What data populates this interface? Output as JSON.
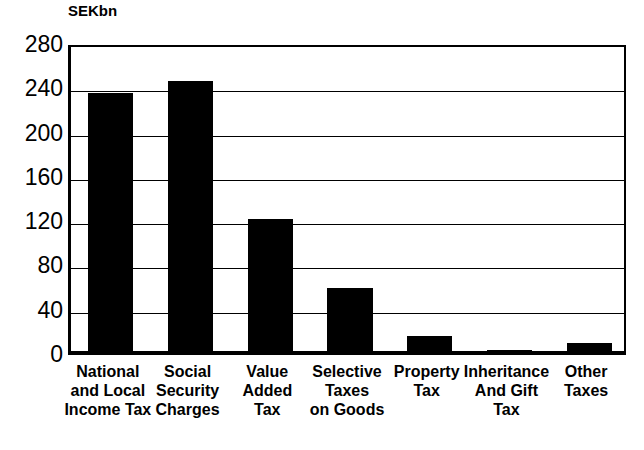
{
  "chart_data": {
    "type": "bar",
    "title": "",
    "unit_label": "SEKbn",
    "xlabel": "",
    "ylabel": "SEKbn",
    "ylim": [
      0,
      280
    ],
    "ytick_step": 40,
    "yticks": [
      280,
      240,
      200,
      160,
      120,
      80,
      40,
      0
    ],
    "ytick_labels": [
      "280",
      "240",
      "200",
      "160",
      "120",
      "80",
      "40",
      "0"
    ],
    "grid": true,
    "legend": "none",
    "categories": [
      "National\nand Local\nIncome Tax",
      "Social\nSecurity\nCharges",
      "Value\nAdded\nTax",
      "Selective\nTaxes\non Goods",
      "Property\nTax",
      "Inheritance\nAnd Gift\nTax",
      "Other\nTaxes"
    ],
    "values": [
      233,
      244,
      119,
      57,
      14,
      1,
      7
    ],
    "bar_color": "#000000",
    "background_color": "#FFFFFF",
    "axis_color": "#000000"
  }
}
